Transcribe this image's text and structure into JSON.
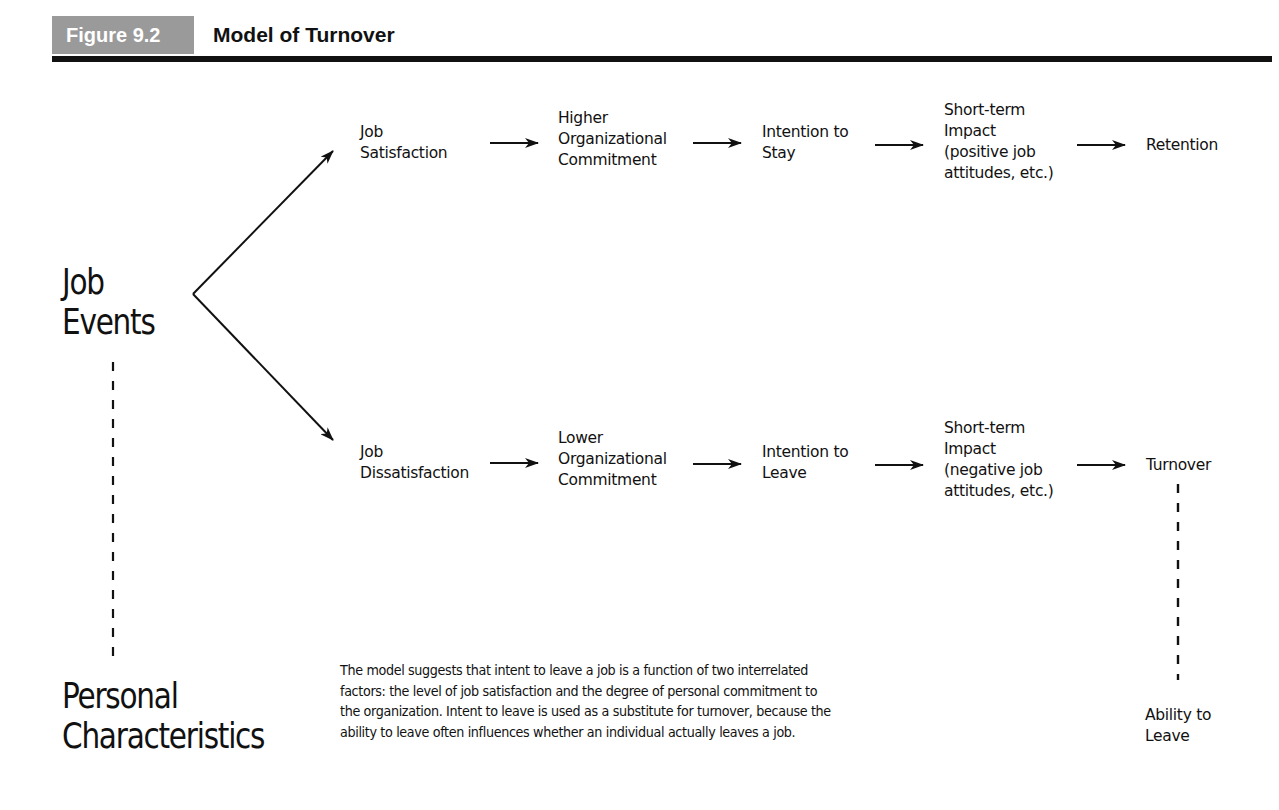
{
  "figure": {
    "label": "Figure 9.2",
    "title": "Model of Turnover",
    "label_bg_color": "#9a9a9a"
  },
  "left": {
    "top_factor": "Job\nEvents",
    "bottom_factor": "Personal\nCharacteristics"
  },
  "paths": {
    "positive": [
      "Job\nSatisfaction",
      "Higher\nOrganizational\nCommitment",
      "Intention to\nStay",
      "Short-term\nImpact\n(positive job\nattitudes, etc.)",
      "Retention"
    ],
    "negative": [
      "Job\nDissatisfaction",
      "Lower\nOrganizational\nCommitment",
      "Intention to\nLeave",
      "Short-term\nImpact\n(negative job\nattitudes, etc.)",
      "Turnover"
    ]
  },
  "moderator": "Ability to\nLeave",
  "caption": "The model suggests that intent to leave a job is a function of two interrelated factors: the level of job satisfaction and the degree of personal commitment to the organization. Intent to leave is used as a substitute for turnover, because the ability to leave often influences whether an individual actually leaves a job."
}
